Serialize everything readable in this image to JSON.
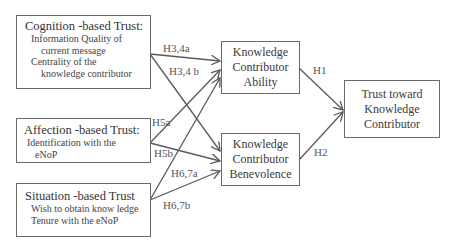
{
  "diagram": {
    "sources": [
      {
        "id": "cognition",
        "title": "Cognition -based Trust:",
        "items": [
          "Information Quality of",
          "current message",
          "Centrality of the",
          "knowledge contributor"
        ]
      },
      {
        "id": "affection",
        "title": "Affection -based Trust:",
        "items": [
          "Identification with the",
          "eNoP"
        ]
      },
      {
        "id": "situation",
        "title": "Situation -based Trust",
        "items": [
          "Wish to obtain know  ledge",
          "Tenure with the eNoP"
        ]
      }
    ],
    "mediators": [
      {
        "id": "ability",
        "lines": [
          "Knowledge",
          "Contributor",
          "Ability"
        ]
      },
      {
        "id": "benevolence",
        "lines": [
          "Knowledge",
          "Contributor",
          "Benevolence"
        ]
      }
    ],
    "outcome": {
      "id": "trust",
      "lines": [
        "Trust toward",
        "Knowledge",
        "Contributor"
      ]
    },
    "hypotheses": {
      "h34a": "H3,4a",
      "h34b": "H3,4 b",
      "h5a": "H5a",
      "h5b": "H5b",
      "h67a": "H6,7a",
      "h67b": "H6,7b",
      "h1": "H1",
      "h2": "H2"
    },
    "edges": [
      {
        "from": "cognition",
        "to": "ability",
        "label": "H3,4a"
      },
      {
        "from": "cognition",
        "to": "benevolence",
        "label": "H3,4 b"
      },
      {
        "from": "affection",
        "to": "ability",
        "label": "H5a"
      },
      {
        "from": "affection",
        "to": "benevolence",
        "label": "H5b"
      },
      {
        "from": "situation",
        "to": "ability",
        "label": "H6,7a"
      },
      {
        "from": "situation",
        "to": "benevolence",
        "label": "H6,7b"
      },
      {
        "from": "ability",
        "to": "trust",
        "label": "H1"
      },
      {
        "from": "benevolence",
        "to": "trust",
        "label": "H2"
      }
    ],
    "colors": {
      "line": "#5a5a5a",
      "border": "#6a6a6a",
      "text": "#3a3a3a"
    }
  }
}
